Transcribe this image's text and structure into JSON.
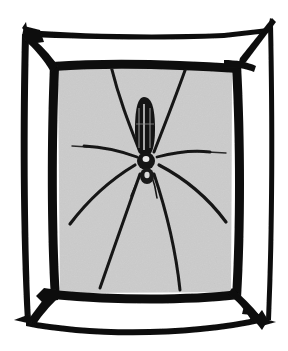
{
  "image": {
    "title": "Spider in a rectangular frame",
    "subject": "long-legged orb-weaver spider",
    "medium": "black ink line engraving",
    "width": 288,
    "height": 351,
    "background_color": "#ffffff",
    "ink_color": "#111111",
    "panel_fill_color": "#d2d2d2",
    "panel_noise_color": "#bdbdbd"
  },
  "frame": {
    "name": "hand-drawn rectangular frame",
    "style": "double-line with spiked corner junctions",
    "inner_panel": {
      "left": 58,
      "top": 68,
      "right": 232,
      "bottom": 294,
      "fill": "#d2d2d2"
    },
    "outer_rails": {
      "top_y": 33,
      "bottom_y": 322,
      "left_x": 24,
      "right_x": 269
    },
    "corners": [
      {
        "name": "corner-top-left",
        "x": 30,
        "y": 33,
        "spike": "up-left"
      },
      {
        "name": "corner-top-right",
        "x": 272,
        "y": 20,
        "spike": "sharp-apex"
      },
      {
        "name": "corner-bottom-left",
        "x": 32,
        "y": 318,
        "spike": "down-left"
      },
      {
        "name": "corner-bottom-right",
        "x": 262,
        "y": 318,
        "spike": "starburst"
      }
    ]
  },
  "spider": {
    "name": "spider",
    "body_center": {
      "x": 146,
      "y": 160
    },
    "abdomen": {
      "name": "abdomen",
      "cx": 144,
      "cy": 127,
      "rx": 9,
      "ry": 30,
      "fill": "#141414",
      "stripe_color": "#cfcfcf",
      "stripe_count": 3
    },
    "cephalothorax": {
      "name": "cephalothorax",
      "cx": 146,
      "cy": 161,
      "rx": 8,
      "ry": 8,
      "fill": "#141414",
      "highlight_color": "#e8e8e8"
    },
    "spinnerets": {
      "name": "spinnerets",
      "cx": 147,
      "cy": 176,
      "rx": 6,
      "ry": 7,
      "fill": "#1a1a1a"
    },
    "leg_count": 8,
    "legs": [
      {
        "name": "leg-front-left-upper",
        "path": "M 140,152 C 128,126 116,98 110,62",
        "width": 3.0
      },
      {
        "name": "leg-front-right-upper",
        "path": "M 154,152 C 166,126 178,98 188,62",
        "width": 3.0
      },
      {
        "name": "leg-front-left-lateral",
        "path": "M 136,158 C 120,152 104,148 84,146",
        "width": 2.6
      },
      {
        "name": "leg-front-right-lateral",
        "path": "M 158,158 C 176,153 194,151 210,152",
        "width": 2.6
      },
      {
        "name": "leg-rear-left-outer",
        "path": "M 136,166 C 116,178 92,196 70,224",
        "width": 3.2
      },
      {
        "name": "leg-rear-right-outer",
        "path": "M 158,166 C 182,178 206,196 226,222",
        "width": 3.2
      },
      {
        "name": "leg-rear-left-lower",
        "path": "M 140,176 C 128,208 112,250 100,288",
        "width": 3.0
      },
      {
        "name": "leg-rear-right-lower",
        "path": "M 154,176 C 166,210 176,252 180,290",
        "width": 3.0
      }
    ]
  },
  "web_threads": [
    {
      "name": "web-thread-left",
      "path": "M 72,146 L 86,147"
    },
    {
      "name": "web-thread-right",
      "path": "M 210,152 L 224,153"
    }
  ]
}
